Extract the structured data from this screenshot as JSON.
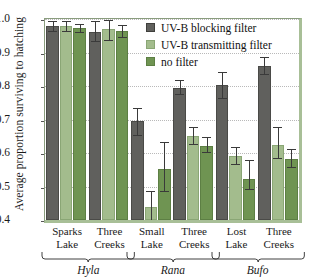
{
  "chart_data": {
    "type": "bar",
    "title": "",
    "xlabel": "",
    "ylabel": "Average proportion surviving to hatching",
    "ylim": [
      0.4,
      1.0
    ],
    "yticks": [
      0.4,
      0.5,
      0.6,
      0.7,
      0.8,
      0.9,
      1.0
    ],
    "ytick_labels": [
      "0.4",
      "0.5",
      "0.6",
      "0.7",
      "0.8",
      "0.9",
      "1.0"
    ],
    "grid": true,
    "legend_position": "top-right",
    "series": [
      {
        "name": "UV-B blocking filter",
        "color": "#60605d",
        "values": [
          0.98,
          0.96,
          0.695,
          0.795,
          0.803,
          0.86
        ],
        "err_low": [
          0.965,
          0.935,
          0.655,
          0.775,
          0.765,
          0.835
        ],
        "err_high": [
          0.995,
          0.995,
          0.735,
          0.818,
          0.843,
          0.888
        ]
      },
      {
        "name": "UV-B transmitting filter",
        "color": "#a3bc8d",
        "values": [
          0.978,
          0.97,
          0.44,
          0.65,
          0.592,
          0.625
        ],
        "err_low": [
          0.963,
          0.938,
          0.4,
          0.628,
          0.568,
          0.585
        ],
        "err_high": [
          0.993,
          0.998,
          0.487,
          0.678,
          0.618,
          0.678
        ]
      },
      {
        "name": "no filter",
        "color": "#6f9452",
        "values": [
          0.973,
          0.963,
          0.553,
          0.622,
          0.521,
          0.581
        ],
        "err_low": [
          0.962,
          0.945,
          0.487,
          0.602,
          0.493,
          0.558
        ],
        "err_high": [
          0.985,
          0.983,
          0.633,
          0.648,
          0.578,
          0.612
        ]
      }
    ],
    "categories": [
      {
        "line1": "Sparks",
        "line2": "Lake",
        "genus": "Hyla"
      },
      {
        "line1": "Three",
        "line2": "Creeks",
        "genus": "Hyla"
      },
      {
        "line1": "Small",
        "line2": "Lake",
        "genus": "Rana"
      },
      {
        "line1": "Three",
        "line2": "Creeks",
        "genus": "Rana"
      },
      {
        "line1": "Lost",
        "line2": "Lake",
        "genus": "Bufo"
      },
      {
        "line1": "Three",
        "line2": "Creeks",
        "genus": "Bufo"
      }
    ],
    "groups": [
      {
        "genus": "Hyla",
        "start": 0,
        "end": 1
      },
      {
        "genus": "Rana",
        "start": 2,
        "end": 3
      },
      {
        "genus": "Bufo",
        "start": 4,
        "end": 5
      }
    ]
  },
  "legend": {
    "items": [
      {
        "label": "UV-B blocking filter"
      },
      {
        "label": "UV-B transmitting filter"
      },
      {
        "label": "no filter"
      }
    ]
  }
}
